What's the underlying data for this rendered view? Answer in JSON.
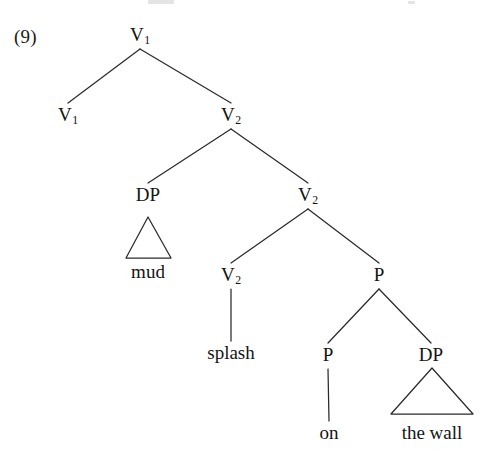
{
  "figure": {
    "example_number": "(9)",
    "type": "syntax-tree",
    "line_color": "#2a2a2a",
    "text_color": "#141414",
    "background": "#ffffff"
  },
  "nodes": [
    {
      "id": "n0",
      "label": "V",
      "subscript": "1",
      "x": 140,
      "y": 25,
      "role": "root",
      "name": "node-v1-root"
    },
    {
      "id": "n1",
      "label": "V",
      "subscript": "1",
      "x": 68,
      "y": 105,
      "role": "category",
      "name": "node-v1-left"
    },
    {
      "id": "n2",
      "label": "V",
      "subscript": "2",
      "x": 231,
      "y": 105,
      "role": "category",
      "name": "node-v2-upper"
    },
    {
      "id": "n3",
      "label": "DP",
      "subscript": "",
      "x": 148,
      "y": 185,
      "role": "category",
      "name": "node-dp-mud"
    },
    {
      "id": "n4",
      "label": "V",
      "subscript": "2",
      "x": 308,
      "y": 185,
      "role": "category",
      "name": "node-v2-mid"
    },
    {
      "id": "n5",
      "label": "V",
      "subscript": "2",
      "x": 231,
      "y": 265,
      "role": "category",
      "name": "node-v2-splash"
    },
    {
      "id": "n6",
      "label": "P",
      "subscript": "",
      "x": 379,
      "y": 265,
      "role": "category",
      "name": "node-p-upper"
    },
    {
      "id": "n7",
      "label": "P",
      "subscript": "",
      "x": 328,
      "y": 345,
      "role": "category",
      "name": "node-p-on"
    },
    {
      "id": "n8",
      "label": "DP",
      "subscript": "",
      "x": 431,
      "y": 345,
      "role": "category",
      "name": "node-dp-the-wall"
    }
  ],
  "leaves": [
    {
      "id": "l1",
      "text": "mud",
      "x": 148,
      "y": 262,
      "name": "leaf-mud"
    },
    {
      "id": "l2",
      "text": "splash",
      "x": 231,
      "y": 343,
      "name": "leaf-splash"
    },
    {
      "id": "l3",
      "text": "on",
      "x": 329,
      "y": 423,
      "name": "leaf-on"
    },
    {
      "id": "l4",
      "text": "the wall",
      "x": 432,
      "y": 423,
      "name": "leaf-the-wall"
    }
  ],
  "branches": [
    {
      "from": "n0",
      "to": "n1",
      "name": "branch-root-to-v1-left"
    },
    {
      "from": "n0",
      "to": "n2",
      "name": "branch-root-to-v2-upper"
    },
    {
      "from": "n2",
      "to": "n3",
      "name": "branch-v2upper-to-dp"
    },
    {
      "from": "n2",
      "to": "n4",
      "name": "branch-v2upper-to-v2mid"
    },
    {
      "from": "n4",
      "to": "n5",
      "name": "branch-v2mid-to-v2splash"
    },
    {
      "from": "n4",
      "to": "n6",
      "name": "branch-v2mid-to-p"
    },
    {
      "from": "n6",
      "to": "n7",
      "name": "branch-p-to-p-on"
    },
    {
      "from": "n6",
      "to": "n8",
      "name": "branch-p-to-dp-wall"
    }
  ],
  "stems": [
    {
      "from": "n5",
      "to": "l2",
      "name": "stem-v2-to-splash"
    },
    {
      "from": "n7",
      "to": "l3",
      "name": "stem-p-to-on"
    }
  ],
  "triangles": [
    {
      "id": "t1",
      "parent": "n3",
      "apex_x": 148,
      "apex_y": 217,
      "left_x": 126,
      "right_x": 171,
      "base_y": 258,
      "name": "triangle-mud"
    },
    {
      "id": "t2",
      "parent": "n8",
      "apex_x": 432,
      "apex_y": 368,
      "left_x": 391,
      "right_x": 473,
      "base_y": 414,
      "name": "triangle-the-wall"
    }
  ],
  "example_number_position": {
    "x": 14,
    "y": 27
  }
}
